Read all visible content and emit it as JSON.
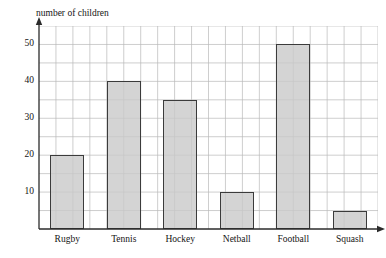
{
  "artifact": {
    "top_clipped_text": ""
  },
  "chart_data": {
    "type": "bar",
    "title": "",
    "xlabel": "",
    "ylabel": "number of children",
    "categories": [
      "Rugby",
      "Tennis",
      "Hockey",
      "Netball",
      "Football",
      "Squash"
    ],
    "values": [
      20,
      40,
      35,
      10,
      50,
      5
    ],
    "ylim": [
      0,
      55
    ],
    "ytick_labels": [
      "10",
      "20",
      "30",
      "40",
      "50"
    ],
    "ytick_values": [
      10,
      20,
      30,
      40,
      50
    ],
    "minor_gridline_step": 5,
    "grid": true,
    "legend": null,
    "bar_fill_color": "#c9c9c9",
    "bar_edge_color": "#3b3b3b",
    "grid_color": "#b9b9b9",
    "axis_color": "#2b2b2b",
    "background_color": "#ffffff",
    "x_axis_arrow": true,
    "y_axis_arrow": true
  }
}
